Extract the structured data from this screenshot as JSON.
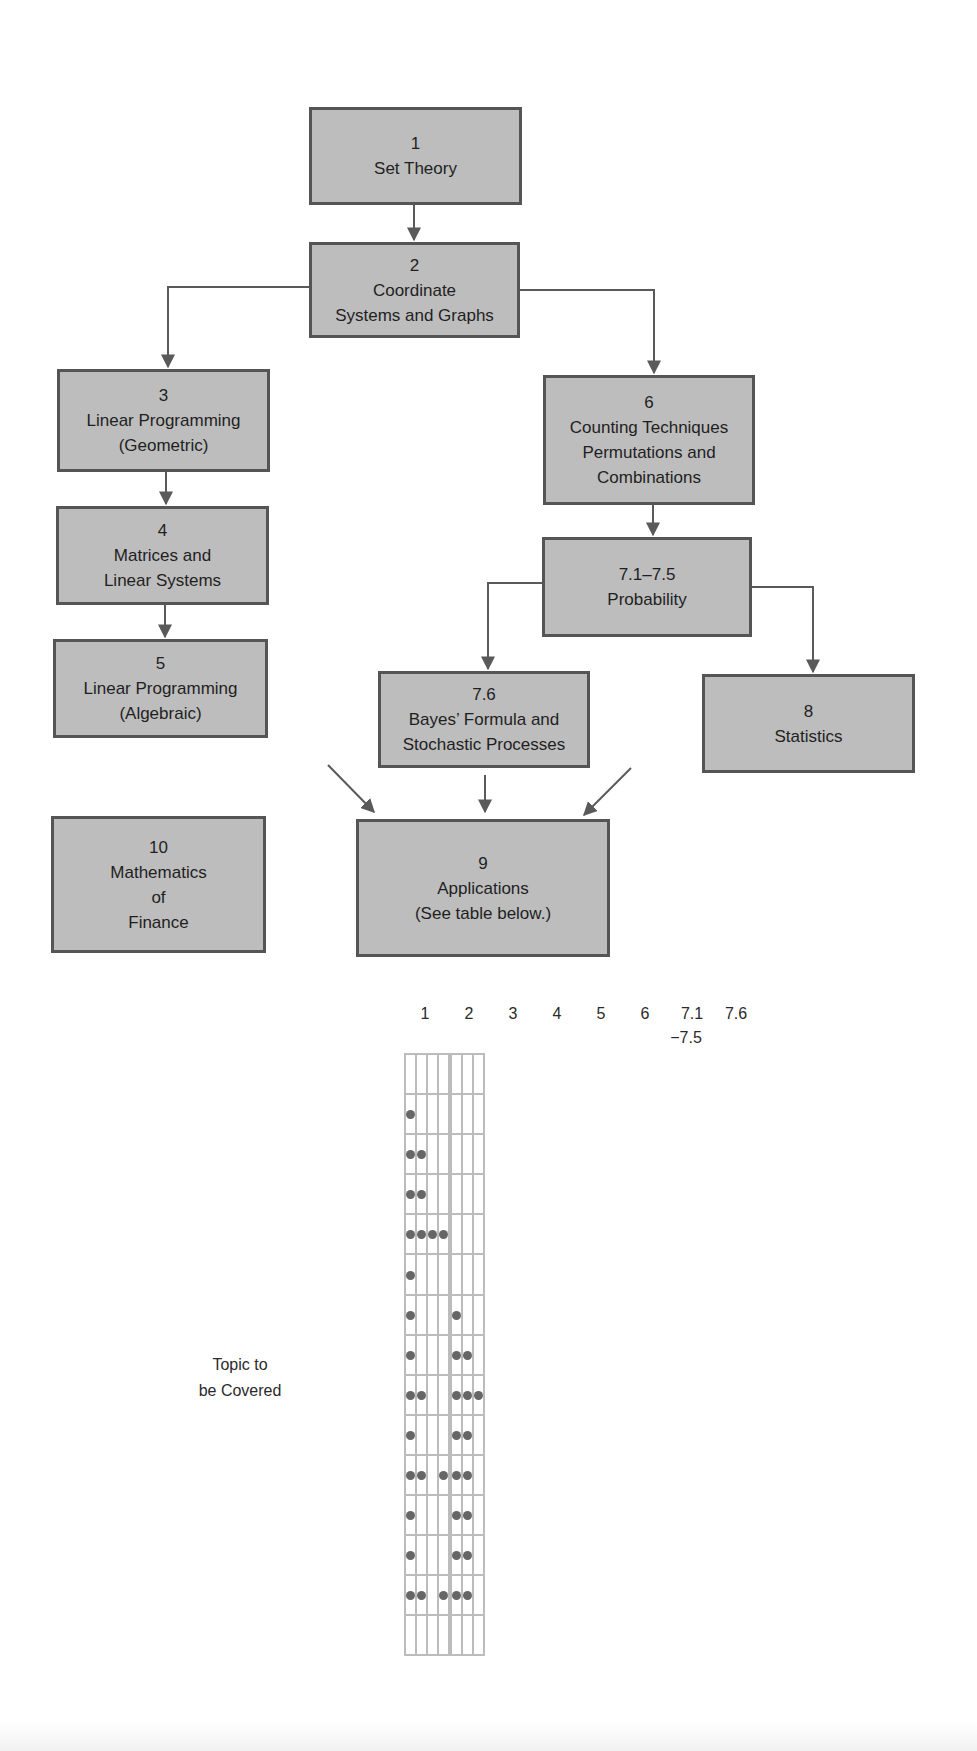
{
  "diagram": {
    "boxes": [
      {
        "id": "b1",
        "number": "1",
        "lines": [
          "Set Theory"
        ]
      },
      {
        "id": "b2",
        "number": "2",
        "lines": [
          "Coordinate",
          "Systems and Graphs"
        ]
      },
      {
        "id": "b3",
        "number": "3",
        "lines": [
          "Linear Programming",
          "(Geometric)"
        ]
      },
      {
        "id": "b4",
        "number": "4",
        "lines": [
          "Matrices and",
          "Linear Systems"
        ]
      },
      {
        "id": "b5",
        "number": "5",
        "lines": [
          "Linear Programming",
          "(Algebraic)"
        ]
      },
      {
        "id": "b6",
        "number": "6",
        "lines": [
          "Counting Techniques",
          "Permutations and",
          "Combinations"
        ]
      },
      {
        "id": "b71",
        "number": "7.1–7.5",
        "lines": [
          "Probability"
        ]
      },
      {
        "id": "b76",
        "number": "7.6",
        "lines": [
          "Bayes’ Formula and",
          "Stochastic Processes"
        ]
      },
      {
        "id": "b8",
        "number": "8",
        "lines": [
          "Statistics"
        ]
      },
      {
        "id": "b9",
        "number": "9",
        "lines": [
          "Applications",
          "(See table below.)"
        ]
      },
      {
        "id": "b10",
        "number": "10",
        "lines": [
          "Mathematics",
          "of",
          "Finance"
        ]
      }
    ],
    "edges": [
      [
        "1",
        "2"
      ],
      [
        "2",
        "3"
      ],
      [
        "2",
        "6"
      ],
      [
        "3",
        "4"
      ],
      [
        "4",
        "5"
      ],
      [
        "6",
        "7.1–7.5"
      ],
      [
        "7.1–7.5",
        "7.6"
      ],
      [
        "7.1–7.5",
        "8"
      ],
      [
        "5",
        "9"
      ],
      [
        "7.6",
        "9"
      ],
      [
        "8",
        "9"
      ]
    ]
  },
  "table": {
    "row_axis_label": [
      "Topic to",
      "be Covered"
    ],
    "columns": [
      {
        "label": "1"
      },
      {
        "label": "2"
      },
      {
        "label": "3"
      },
      {
        "label": "4"
      },
      {
        "label": "5"
      },
      {
        "label": "6"
      },
      {
        "label": "7.1",
        "label2": "−7.5"
      },
      {
        "label": "7.6"
      }
    ],
    "rows": [
      {
        "label": "1",
        "marks": [
          0,
          0,
          0,
          0,
          0,
          0,
          0,
          0
        ]
      },
      {
        "label": "2",
        "marks": [
          1,
          0,
          0,
          0,
          0,
          0,
          0,
          0
        ]
      },
      {
        "label": "3",
        "marks": [
          1,
          1,
          0,
          0,
          0,
          0,
          0,
          0
        ]
      },
      {
        "label": "4",
        "marks": [
          1,
          1,
          0,
          0,
          0,
          0,
          0,
          0
        ]
      },
      {
        "label": "5",
        "marks": [
          1,
          1,
          1,
          1,
          0,
          0,
          0,
          0
        ]
      },
      {
        "label": "6",
        "marks": [
          1,
          0,
          0,
          0,
          0,
          0,
          0,
          0
        ]
      },
      {
        "label": "7.1–7.5",
        "marks": [
          1,
          0,
          0,
          0,
          0,
          1,
          0,
          0
        ]
      },
      {
        "label": "7.6",
        "marks": [
          1,
          0,
          0,
          0,
          0,
          1,
          1,
          0
        ]
      },
      {
        "label": "8",
        "marks": [
          1,
          1,
          0,
          0,
          0,
          1,
          1,
          1
        ]
      },
      {
        "label": "9.1",
        "marks": [
          1,
          0,
          0,
          0,
          0,
          1,
          1,
          0
        ]
      },
      {
        "label": "9.2–9.3",
        "marks": [
          1,
          1,
          0,
          1,
          0,
          1,
          1,
          0
        ]
      },
      {
        "label": "9.4",
        "marks": [
          1,
          0,
          0,
          0,
          0,
          1,
          1,
          0
        ]
      },
      {
        "label": "9.5",
        "marks": [
          1,
          0,
          0,
          0,
          0,
          1,
          1,
          0
        ]
      },
      {
        "label": "9.6",
        "marks": [
          1,
          1,
          0,
          1,
          0,
          1,
          1,
          0
        ]
      },
      {
        "label": "10",
        "marks": [
          0,
          0,
          0,
          0,
          0,
          0,
          0,
          0
        ]
      }
    ]
  },
  "colors": {
    "box_fill": "#bdbdbd",
    "box_border": "#555555",
    "arrow": "#5a5a5a",
    "grid_line": "#bcbcbc",
    "dot": "#666666"
  }
}
